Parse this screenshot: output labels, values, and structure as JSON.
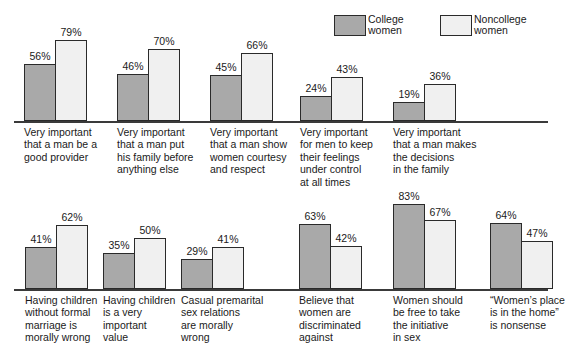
{
  "legend": {
    "items": [
      {
        "key": "college",
        "label": "College\nwomen",
        "color": "#a9a9a9",
        "swatch": "dark-swatch"
      },
      {
        "key": "noncollege",
        "label": "Noncollege\nwomen",
        "color": "#f0f0f0",
        "swatch": "light-swatch"
      }
    ]
  },
  "chart_data": {
    "type": "bar",
    "title": "",
    "xlabel": "",
    "ylabel": "",
    "ylim": [
      0,
      100
    ],
    "grid": false,
    "legend_position": "top-right",
    "value_suffix": "%",
    "series": [
      {
        "name": "College women",
        "color": "#a9a9a9",
        "values": [
          56,
          46,
          45,
          24,
          19,
          41,
          35,
          29,
          63,
          83,
          64
        ]
      },
      {
        "name": "Noncollege women",
        "color": "#f0f0f0",
        "values": [
          79,
          70,
          66,
          43,
          36,
          62,
          50,
          41,
          42,
          67,
          47
        ]
      }
    ],
    "categories": [
      "Very important\nthat a man be a\ngood provider",
      "Very important\nthat a man put\nhis family before\nanything else",
      "Very important\nthat a man show\nwomen courtesy\nand respect",
      "Very important\nfor men to keep\ntheir feelings\nunder control\nat all times",
      "Very important\nthat a man makes\nthe decisions\nin the family",
      "Having children\nwithout formal\nmarriage is\nmorally wrong",
      "Having children\nis a very\nimportant\nvalue",
      "Casual premarital\nsex relations\nare morally\nwrong",
      "Believe that\nwomen are\ndiscriminated\nagainst",
      "Women should\nbe free to take\nthe initiative\nin sex",
      "“Women’s place\nis in the home”\nis nonsense"
    ],
    "panels": [
      {
        "name": "top-row",
        "category_indices": [
          0,
          1,
          2,
          3,
          4
        ]
      },
      {
        "name": "bottom-row",
        "category_indices": [
          5,
          6,
          7,
          8,
          9,
          10
        ]
      }
    ],
    "labels": {
      "top": [
        {
          "college": "56%",
          "noncollege": "79%"
        },
        {
          "college": "46%",
          "noncollege": "70%"
        },
        {
          "college": "45%",
          "noncollege": "66%"
        },
        {
          "college": "24%",
          "noncollege": "43%"
        },
        {
          "college": "19%",
          "noncollege": "36%"
        }
      ],
      "bottom": [
        {
          "college": "41%",
          "noncollege": "62%"
        },
        {
          "college": "35%",
          "noncollege": "50%"
        },
        {
          "college": "29%",
          "noncollege": "41%"
        },
        {
          "college": "63%",
          "noncollege": "42%"
        },
        {
          "college": "83%",
          "noncollege": "67%"
        },
        {
          "college": "64%",
          "noncollege": "47%"
        }
      ]
    }
  }
}
